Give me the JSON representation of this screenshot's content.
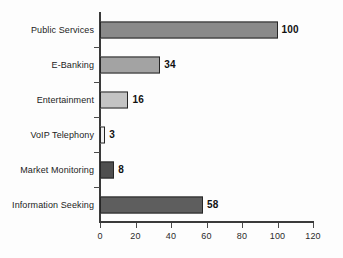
{
  "chart_data": {
    "type": "bar",
    "orientation": "horizontal",
    "title": "",
    "subtitle": "",
    "xlabel": "",
    "ylabel": "",
    "categories": [
      "Public Services",
      "E-Banking",
      "Entertainment",
      "VoIP Telephony",
      "Market Monitoring",
      "Information Seeking"
    ],
    "values": [
      100,
      34,
      16,
      3,
      8,
      58
    ],
    "value_labels": [
      "100",
      "34",
      "16",
      "3",
      "8",
      "58"
    ],
    "bar_colors": [
      "#8a8a8a",
      "#a3a3a3",
      "#c4c4c4",
      "#f2f2f2",
      "#4f4f4f",
      "#5e5e5e"
    ],
    "xlim": [
      0,
      120
    ],
    "xticks": [
      0,
      20,
      40,
      60,
      80,
      100,
      120
    ],
    "xtick_labels": [
      "0",
      "20",
      "40",
      "60",
      "80",
      "100",
      "120"
    ],
    "grid": false,
    "legend": null,
    "legend_position": "none",
    "data_labels_shown": true,
    "axis_color": "#3a3a3a",
    "bar_edge_color": "#262626",
    "background": "#ffffff"
  }
}
